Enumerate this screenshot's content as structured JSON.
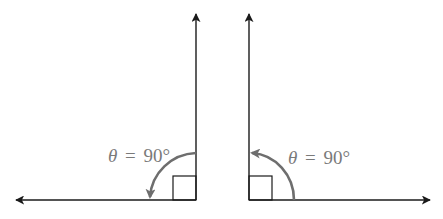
{
  "colors": {
    "axis": "#1a1a1a",
    "arc": "#6e6e6e",
    "label": "#7a7a7a",
    "background": "#ffffff"
  },
  "figures": [
    {
      "id": "left",
      "description": "Right angle opening to the left, arc sweeping counter-clockwise from vertical ray down to horizontal ray",
      "label": {
        "symbol": "θ",
        "equals": "=",
        "value": "90°"
      },
      "rays": [
        "up",
        "left"
      ],
      "right_angle_marker": true
    },
    {
      "id": "right",
      "description": "Right angle opening to the right, arc sweeping counter-clockwise from horizontal ray up to vertical ray",
      "label": {
        "symbol": "θ",
        "equals": "=",
        "value": "90°"
      },
      "rays": [
        "up",
        "right"
      ],
      "right_angle_marker": true
    }
  ]
}
